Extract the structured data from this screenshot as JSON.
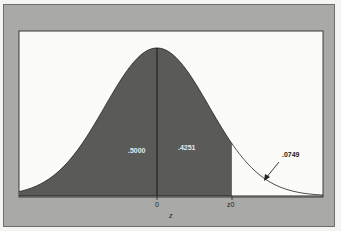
{
  "chart_data": {
    "type": "area",
    "title": "",
    "xlabel": "z",
    "ylabel": "",
    "distribution": "standard normal",
    "tick_labels": [
      "0",
      "z0"
    ],
    "shaded_regions": [
      {
        "label": ".5000",
        "from": "-inf",
        "to": "0",
        "area": 0.5
      },
      {
        "label": ".4251",
        "from": "0",
        "to": "z0",
        "area": 0.4251
      }
    ],
    "unshaded_regions": [
      {
        "label": ".0749",
        "from": "z0",
        "to": "+inf",
        "area": 0.0749,
        "annotation": "arrow"
      }
    ],
    "z0_value_implied": 1.44,
    "xlim": [
      -3.2,
      3.2
    ],
    "grid": false,
    "legend": "none"
  },
  "labels": {
    "left_area": ".5000",
    "middle_area": ".4251",
    "tail_area": ".0749",
    "tick_zero": "0",
    "tick_z0": "z0",
    "axis_label": "z"
  },
  "colors": {
    "frame": "#a9a9a7",
    "plot_bg": "#fbfbf9",
    "shade": "#5a5a58",
    "curve": "#222222"
  }
}
